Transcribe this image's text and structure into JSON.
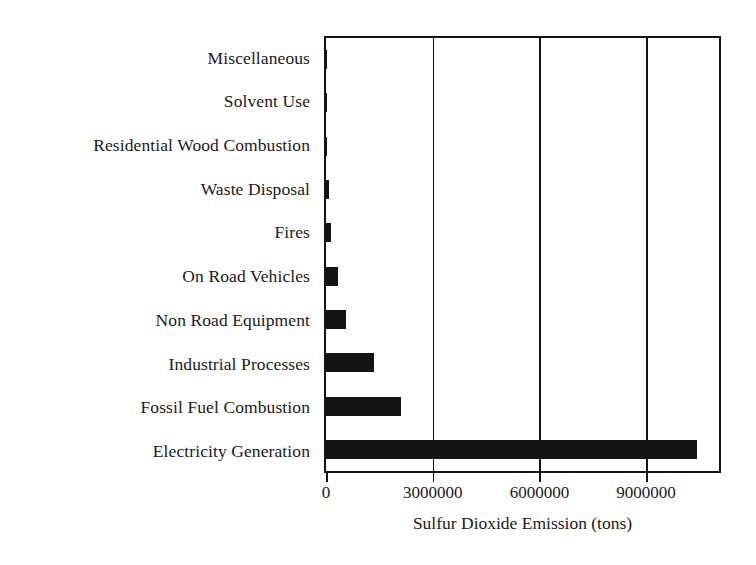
{
  "chart_data": {
    "type": "bar",
    "orientation": "horizontal",
    "title": "",
    "subtitle": "",
    "xlabel": "Sulfur Dioxide Emission (tons)",
    "ylabel": "",
    "categories": [
      "Miscellaneous",
      "Solvent Use",
      "Residential Wood Combustion",
      "Waste Disposal",
      "Fires",
      "On Road Vehicles",
      "Non Road Equipment",
      "Industrial Processes",
      "Fossil Fuel Combustion",
      "Electricity Generation"
    ],
    "values": [
      10000,
      5000,
      30000,
      85000,
      140000,
      330000,
      560000,
      1340000,
      2120000,
      10420000
    ],
    "xlim": [
      0,
      11050000
    ],
    "xticks": [
      0,
      3000000,
      6000000,
      9000000
    ],
    "xtick_labels": [
      "0",
      "3000000",
      "6000000",
      "9000000"
    ],
    "grid": "vertical-only",
    "legend": "none",
    "bar_color": "#141414",
    "axis_color": "#141414",
    "background_color": "#ffffff"
  }
}
